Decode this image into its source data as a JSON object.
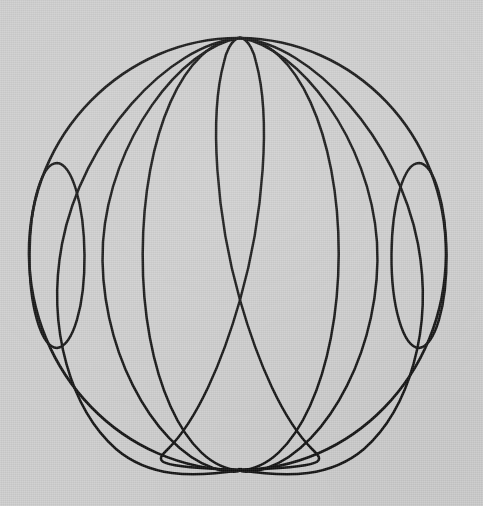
{
  "image": {
    "kind": "line-drawing",
    "subject": "wireframe-sphere",
    "description": "Hand drawn wireframe sphere with meridian ellipses converging at the top and bottom poles, plus two narrow standalone ellipses near the left and right limbs.",
    "width": 483,
    "height": 506,
    "background_color": "#cdcdcd",
    "ink_color": "#121212",
    "stroke_width": 2.4,
    "text_present": "none"
  },
  "geometry": {
    "poles": {
      "top": {
        "x": 240,
        "y": 38
      },
      "bottom": {
        "x": 240,
        "y": 470
      }
    },
    "outer_circle": {
      "label": "sphere-outline",
      "cx": 238,
      "cy": 254,
      "rx": 209,
      "ry": 216,
      "rotation": -1.2
    },
    "equator_crossings_x": [
      29.3,
      83.3,
      142.7,
      181.0,
      298.0,
      338.7,
      397.0,
      450.3
    ],
    "meridians": [
      {
        "label": "meridian-wide",
        "cx": 240.5,
        "cy": 254,
        "rx": 98,
        "ry": 216,
        "rotation": -0.8
      },
      {
        "label": "meridian-mid-left",
        "cx": 239.0,
        "cy": 254,
        "rx": 59,
        "ry": 216,
        "rotation": -22.0
      },
      {
        "label": "meridian-mid-right",
        "cx": 241.0,
        "cy": 254,
        "rx": 59,
        "ry": 216,
        "rotation": 22.0
      },
      {
        "label": "meridian-narrow-left",
        "cx": 239.0,
        "cy": 254,
        "rx": 21,
        "ry": 216,
        "rotation": -44.0
      },
      {
        "label": "meridian-narrow-right",
        "cx": 241.0,
        "cy": 254,
        "rx": 21,
        "ry": 216,
        "rotation": 44.0
      }
    ],
    "limb_ellipses": [
      {
        "label": "limb-ellipse-left",
        "cx": 57,
        "cy": 255,
        "rx": 27.5,
        "ry": 93,
        "rotation": -2.0
      },
      {
        "label": "limb-ellipse-right",
        "cx": 419,
        "cy": 255,
        "rx": 27.5,
        "ry": 93,
        "rotation": 2.0
      }
    ]
  },
  "chart_data": {
    "type": "scatter",
    "title": "",
    "xlabel": "",
    "ylabel": "",
    "xlim": [
      0,
      483
    ],
    "ylim": [
      0,
      506
    ],
    "grid": false,
    "legend": "none",
    "annotations": [],
    "series": [
      {
        "name": "sphere-outline",
        "shape": "ellipse",
        "cx": 238,
        "cy": 254,
        "rx": 209,
        "ry": 216
      },
      {
        "name": "meridian-wide",
        "shape": "ellipse",
        "cx": 240.5,
        "cy": 254,
        "rx": 98,
        "ry": 216
      },
      {
        "name": "meridian-mid-left",
        "shape": "ellipse-rotated",
        "cx": 239,
        "cy": 254,
        "rx": 59,
        "ry": 216,
        "rotation": -22
      },
      {
        "name": "meridian-mid-right",
        "shape": "ellipse-rotated",
        "cx": 241,
        "cy": 254,
        "rx": 59,
        "ry": 216,
        "rotation": 22
      },
      {
        "name": "meridian-narrow-left",
        "shape": "ellipse-rotated",
        "cx": 239,
        "cy": 254,
        "rx": 21,
        "ry": 216,
        "rotation": -44
      },
      {
        "name": "meridian-narrow-right",
        "shape": "ellipse-rotated",
        "cx": 241,
        "cy": 254,
        "rx": 21,
        "ry": 216,
        "rotation": 44
      },
      {
        "name": "limb-ellipse-left",
        "shape": "ellipse",
        "cx": 57,
        "cy": 255,
        "rx": 27.5,
        "ry": 93
      },
      {
        "name": "limb-ellipse-right",
        "shape": "ellipse",
        "cx": 419,
        "cy": 255,
        "rx": 27.5,
        "ry": 93
      }
    ]
  }
}
